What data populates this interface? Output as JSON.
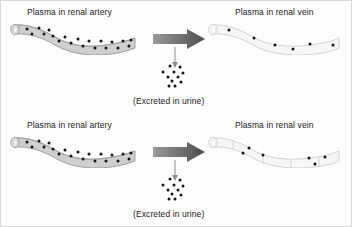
{
  "figure": {
    "title_text_color": "#1b1b1b",
    "background": "#fdfdfd",
    "panels": [
      {
        "id": "top",
        "artery_label": "Plasma in renal artery",
        "vein_label": "Plasma in renal vein",
        "urine_label": "(Excreted in urine)",
        "artery_fill": "#cfcfcf",
        "vein_fill": "#f7f7f7",
        "arrow_color_start": "#9a9a9a",
        "arrow_color_end": "#4d4d4d",
        "vein_segmented": false,
        "artery_dot_count": 20,
        "vein_dot_count": 6,
        "urine_dot_count": 11
      },
      {
        "id": "bottom",
        "artery_label": "Plasma in renal artery",
        "vein_label": "Plasma in renal vein",
        "urine_label": "(Excreted in urine)",
        "artery_fill": "#cfcfcf",
        "vein_fill": "#f7f7f7",
        "arrow_color_start": "#9a9a9a",
        "arrow_color_end": "#4d4d4d",
        "vein_segmented": true,
        "artery_dot_count": 20,
        "vein_dot_count": 6,
        "urine_dot_count": 11
      }
    ],
    "icons": {
      "block_arrow": "right-block-arrow-icon",
      "thin_arrow": "down-thin-arrow-icon",
      "solute_dot": "solute-dot-icon"
    }
  }
}
